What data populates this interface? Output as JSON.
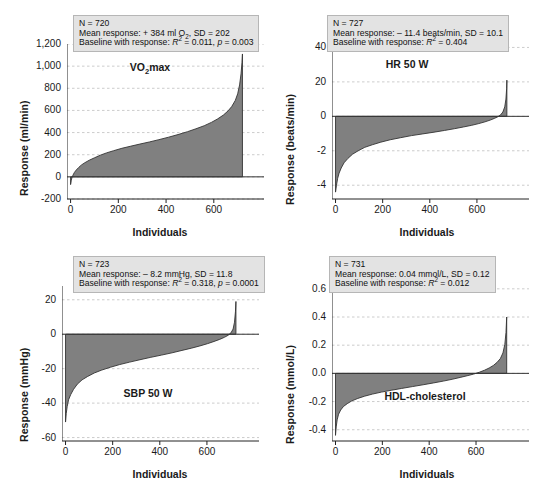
{
  "figure": {
    "width": 554,
    "height": 485,
    "fill_color": "#808080",
    "line_color": "#333333",
    "grid_color": "#bfbfbf",
    "box_bg": "#e3e3e3"
  },
  "chart_data": [
    {
      "type": "area",
      "id": "vo2max",
      "title": "VO2max",
      "title_html": "VO<sub>2</sub>max",
      "xlabel": "Individuals",
      "ylabel": "Response (ml/min)",
      "xlim": [
        -15,
        760
      ],
      "ylim": [
        -200,
        1200
      ],
      "xticks": [
        0,
        200,
        400,
        600
      ],
      "xticklabels": [
        "0",
        "200",
        "400",
        "600"
      ],
      "yticks": [
        -200,
        0,
        200,
        400,
        600,
        800,
        1000,
        1200
      ],
      "yticklabels": [
        "-200",
        "0",
        "200",
        "400",
        "600",
        "800",
        "1,000",
        "1,200"
      ],
      "grid": true,
      "n": 720,
      "stats": {
        "n_label": "N = 720",
        "mean_label": "Mean response: + 384 ml O2, SD = 202",
        "mean_prefix": "Mean response: + 384 ml O",
        "mean_sub": "2",
        "mean_suffix": ", SD = 202",
        "baseline_prefix": "Baseline with response: ",
        "baseline_r2": "R",
        "baseline_r2_sup": "2",
        "baseline_r2_val": " = 0.011, ",
        "baseline_p": "p",
        "baseline_p_val": " = 0.003"
      },
      "curve": [
        [
          0,
          -70
        ],
        [
          3,
          -30
        ],
        [
          6,
          -5
        ],
        [
          10,
          15
        ],
        [
          16,
          40
        ],
        [
          24,
          62
        ],
        [
          34,
          85
        ],
        [
          46,
          108
        ],
        [
          60,
          128
        ],
        [
          78,
          150
        ],
        [
          100,
          172
        ],
        [
          125,
          196
        ],
        [
          150,
          216
        ],
        [
          180,
          236
        ],
        [
          215,
          258
        ],
        [
          250,
          276
        ],
        [
          290,
          296
        ],
        [
          330,
          315
        ],
        [
          370,
          336
        ],
        [
          410,
          358
        ],
        [
          450,
          382
        ],
        [
          490,
          408
        ],
        [
          525,
          434
        ],
        [
          560,
          462
        ],
        [
          590,
          492
        ],
        [
          615,
          522
        ],
        [
          640,
          558
        ],
        [
          660,
          596
        ],
        [
          675,
          635
        ],
        [
          690,
          690
        ],
        [
          700,
          750
        ],
        [
          708,
          830
        ],
        [
          714,
          930
        ],
        [
          718,
          1030
        ],
        [
          720,
          1110
        ]
      ]
    },
    {
      "type": "area",
      "id": "hr50w",
      "title": "HR 50 W",
      "title_html": "HR 50 W",
      "xlabel": "Individuals",
      "ylabel": "Response (beats/min)",
      "xlim": [
        -15,
        770
      ],
      "ylim": [
        -48,
        42
      ],
      "xticks": [
        0,
        200,
        400,
        600
      ],
      "xticklabels": [
        "0",
        "200",
        "400",
        "600"
      ],
      "yticks": [
        -40,
        -20,
        0,
        20,
        40
      ],
      "yticklabels": [
        "-4",
        "-2",
        "0",
        "20",
        "40"
      ],
      "grid": true,
      "n": 727,
      "stats": {
        "n_label": "N = 727",
        "mean_label": "Mean response: – 11.4 beats/min, SD = 10.1",
        "mean_prefix": "Mean response: – 11.4 beats/min, SD = 10.1",
        "mean_sub": "",
        "mean_suffix": "",
        "baseline_prefix": "Baseline with response: ",
        "baseline_r2": "R",
        "baseline_r2_sup": "2",
        "baseline_r2_val": " = 0.404",
        "baseline_p": "",
        "baseline_p_val": ""
      },
      "curve": [
        [
          0,
          -44
        ],
        [
          4,
          -40
        ],
        [
          9,
          -36
        ],
        [
          15,
          -33
        ],
        [
          24,
          -30
        ],
        [
          36,
          -27
        ],
        [
          52,
          -24.5
        ],
        [
          72,
          -22
        ],
        [
          96,
          -20
        ],
        [
          124,
          -18
        ],
        [
          156,
          -16.5
        ],
        [
          192,
          -15
        ],
        [
          232,
          -13.6
        ],
        [
          276,
          -12.4
        ],
        [
          322,
          -11.2
        ],
        [
          370,
          -10.2
        ],
        [
          418,
          -9.2
        ],
        [
          462,
          -8.2
        ],
        [
          504,
          -7.2
        ],
        [
          542,
          -6.2
        ],
        [
          578,
          -5.2
        ],
        [
          608,
          -4.2
        ],
        [
          634,
          -3.2
        ],
        [
          656,
          -2.2
        ],
        [
          674,
          -1.2
        ],
        [
          688,
          -0.3
        ],
        [
          700,
          0.8
        ],
        [
          710,
          2.5
        ],
        [
          718,
          5.5
        ],
        [
          723,
          10
        ],
        [
          726,
          16
        ],
        [
          727,
          21
        ]
      ]
    },
    {
      "type": "area",
      "id": "sbp50w",
      "title": "SBP 50 W",
      "title_html": "SBP 50 W",
      "xlabel": "Individuals",
      "ylabel": "Response (mmHg)",
      "xlim": [
        -15,
        770
      ],
      "ylim": [
        -62,
        28
      ],
      "xticks": [
        0,
        200,
        400,
        600
      ],
      "xticklabels": [
        "0",
        "200",
        "400",
        "600"
      ],
      "yticks": [
        -60,
        -40,
        -20,
        0,
        20
      ],
      "yticklabels": [
        "-60",
        "-40",
        "-20",
        "0",
        "20"
      ],
      "grid": true,
      "n": 723,
      "stats": {
        "n_label": "N = 723",
        "mean_label": "Mean response: – 8.2 mmHg, SD = 11.8",
        "mean_prefix": "Mean response: – 8.2 mmHg, SD = 11.8",
        "mean_sub": "",
        "mean_suffix": "",
        "baseline_prefix": "Baseline with response: ",
        "baseline_r2": "R",
        "baseline_r2_sup": "2",
        "baseline_r2_val": " = 0.318, ",
        "baseline_p": "p",
        "baseline_p_val": " = 0.0001"
      },
      "curve": [
        [
          0,
          -51
        ],
        [
          3,
          -46
        ],
        [
          7,
          -42
        ],
        [
          13,
          -38
        ],
        [
          22,
          -35
        ],
        [
          34,
          -32
        ],
        [
          50,
          -29
        ],
        [
          70,
          -26.5
        ],
        [
          94,
          -24.5
        ],
        [
          122,
          -22.5
        ],
        [
          154,
          -20.8
        ],
        [
          190,
          -19.2
        ],
        [
          230,
          -17.6
        ],
        [
          272,
          -16.2
        ],
        [
          316,
          -14.8
        ],
        [
          362,
          -13.4
        ],
        [
          408,
          -12.1
        ],
        [
          452,
          -10.8
        ],
        [
          494,
          -9.4
        ],
        [
          534,
          -8.1
        ],
        [
          570,
          -6.8
        ],
        [
          602,
          -5.5
        ],
        [
          630,
          -4.2
        ],
        [
          654,
          -3.0
        ],
        [
          674,
          -1.8
        ],
        [
          690,
          -0.6
        ],
        [
          702,
          0.8
        ],
        [
          711,
          3.0
        ],
        [
          717,
          7.0
        ],
        [
          721,
          13
        ],
        [
          723,
          19
        ]
      ]
    },
    {
      "type": "area",
      "id": "hdl",
      "title": "HDL-cholesterol",
      "title_html": "HDL-cholesterol",
      "xlabel": "Individuals",
      "ylabel": "Response (mmol/L)",
      "xlim": [
        -15,
        775
      ],
      "ylim": [
        -0.48,
        0.62
      ],
      "xticks": [
        0,
        200,
        400,
        600
      ],
      "xticklabels": [
        "0",
        "200",
        "400",
        "600"
      ],
      "yticks": [
        -0.4,
        -0.2,
        0.0,
        0.2,
        0.4,
        0.6
      ],
      "yticklabels": [
        "-0.4",
        "-0.2",
        "0.0",
        "0.2",
        "0.4",
        "0.6"
      ],
      "grid": true,
      "n": 731,
      "stats": {
        "n_label": "N = 731",
        "mean_label": "Mean response: 0.04 mmol/L, SD = 0.12",
        "mean_prefix": "Mean response: 0.04 mmol/L, SD = 0.12",
        "mean_sub": "",
        "mean_suffix": "",
        "baseline_prefix": "Baseline with response: ",
        "baseline_r2": "R",
        "baseline_r2_sup": "2",
        "baseline_r2_val": " = 0.012",
        "baseline_p": "",
        "baseline_p_val": ""
      },
      "curve": [
        [
          0,
          -0.44
        ],
        [
          3,
          -0.38
        ],
        [
          7,
          -0.33
        ],
        [
          13,
          -0.29
        ],
        [
          22,
          -0.26
        ],
        [
          34,
          -0.235
        ],
        [
          50,
          -0.215
        ],
        [
          70,
          -0.195
        ],
        [
          95,
          -0.178
        ],
        [
          124,
          -0.162
        ],
        [
          158,
          -0.147
        ],
        [
          196,
          -0.133
        ],
        [
          238,
          -0.12
        ],
        [
          282,
          -0.107
        ],
        [
          328,
          -0.094
        ],
        [
          374,
          -0.081
        ],
        [
          418,
          -0.068
        ],
        [
          460,
          -0.055
        ],
        [
          498,
          -0.042
        ],
        [
          532,
          -0.029
        ],
        [
          562,
          -0.017
        ],
        [
          590,
          -0.005
        ],
        [
          614,
          0.008
        ],
        [
          636,
          0.022
        ],
        [
          656,
          0.038
        ],
        [
          674,
          0.056
        ],
        [
          690,
          0.078
        ],
        [
          704,
          0.105
        ],
        [
          715,
          0.145
        ],
        [
          723,
          0.205
        ],
        [
          728,
          0.29
        ],
        [
          731,
          0.4
        ]
      ]
    }
  ]
}
